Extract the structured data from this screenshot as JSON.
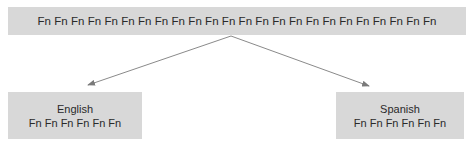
{
  "diagram": {
    "type": "tree",
    "root": {
      "text": "Fn Fn Fn Fn Fn Fn Fn Fn Fn Fn Fn Fn Fn Fn Fn Fn Fn Fn Fn Fn Fn Fn Fn Fn"
    },
    "children": [
      {
        "title": "English",
        "text": "Fn Fn Fn Fn Fn Fn"
      },
      {
        "title": "Spanish",
        "text": "Fn Fn Fn Fn Fn Fn"
      }
    ],
    "edges": [
      {
        "from": "root",
        "to": "English"
      },
      {
        "from": "root",
        "to": "Spanish"
      }
    ],
    "colors": {
      "node_fill": "#d8d8d8",
      "edge": "#888888",
      "text": "#2a2a2a"
    }
  }
}
